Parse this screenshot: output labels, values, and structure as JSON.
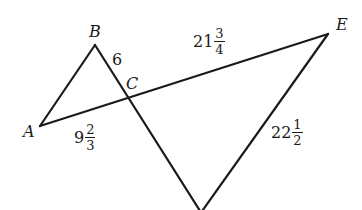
{
  "diagram": {
    "type": "geometry-figure",
    "stroke_color": "#1a1a1a",
    "points": {
      "A": {
        "label": "A",
        "x": 40,
        "y": 126
      },
      "B": {
        "label": "B",
        "x": 95,
        "y": 45
      },
      "C": {
        "label": "C",
        "x": 128,
        "y": 97
      },
      "E": {
        "label": "E",
        "x": 328,
        "y": 34
      },
      "D": {
        "label": "",
        "x": 200,
        "y": 212
      }
    },
    "segments": [
      {
        "from": "A",
        "to": "B"
      },
      {
        "from": "B",
        "to": "D",
        "through": "C"
      },
      {
        "from": "A",
        "to": "E",
        "through": "C"
      },
      {
        "from": "E",
        "to": "D"
      }
    ],
    "measures": {
      "BC": {
        "text": "6"
      },
      "AC": {
        "whole": "9",
        "num": "2",
        "den": "3",
        "text": "9 2/3"
      },
      "CE": {
        "whole": "21",
        "num": "3",
        "den": "4",
        "text": "21 3/4"
      },
      "ED": {
        "whole": "22",
        "num": "1",
        "den": "2",
        "text": "22 1/2"
      }
    }
  }
}
